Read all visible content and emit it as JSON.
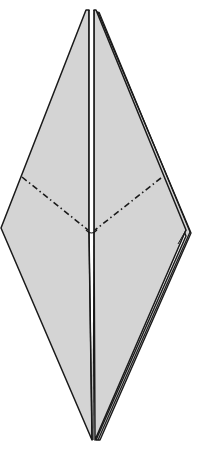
{
  "diagram": {
    "type": "origami-fold-step",
    "colors": {
      "paper": "#d4d4d4",
      "outline": "#1a1a1a",
      "background": "#ffffff",
      "gap": "#ffffff"
    },
    "shapes": {
      "left_flap": "86,10 1,228 92,440 89,232",
      "right_flap": "96,10 190,232 95,440 94,232",
      "back_layer_right": "100,12 192,234 99,440 186,240",
      "center_slit": "89,10 96,10 94,232 89,232"
    },
    "fold_lines": [
      {
        "name": "left-valley-fold",
        "x1": 22,
        "y1": 177,
        "x2": 89,
        "y2": 232,
        "style": "dash-dot"
      },
      {
        "name": "right-valley-fold",
        "x1": 161,
        "y1": 178,
        "x2": 94,
        "y2": 232,
        "style": "dash-dot"
      }
    ]
  }
}
